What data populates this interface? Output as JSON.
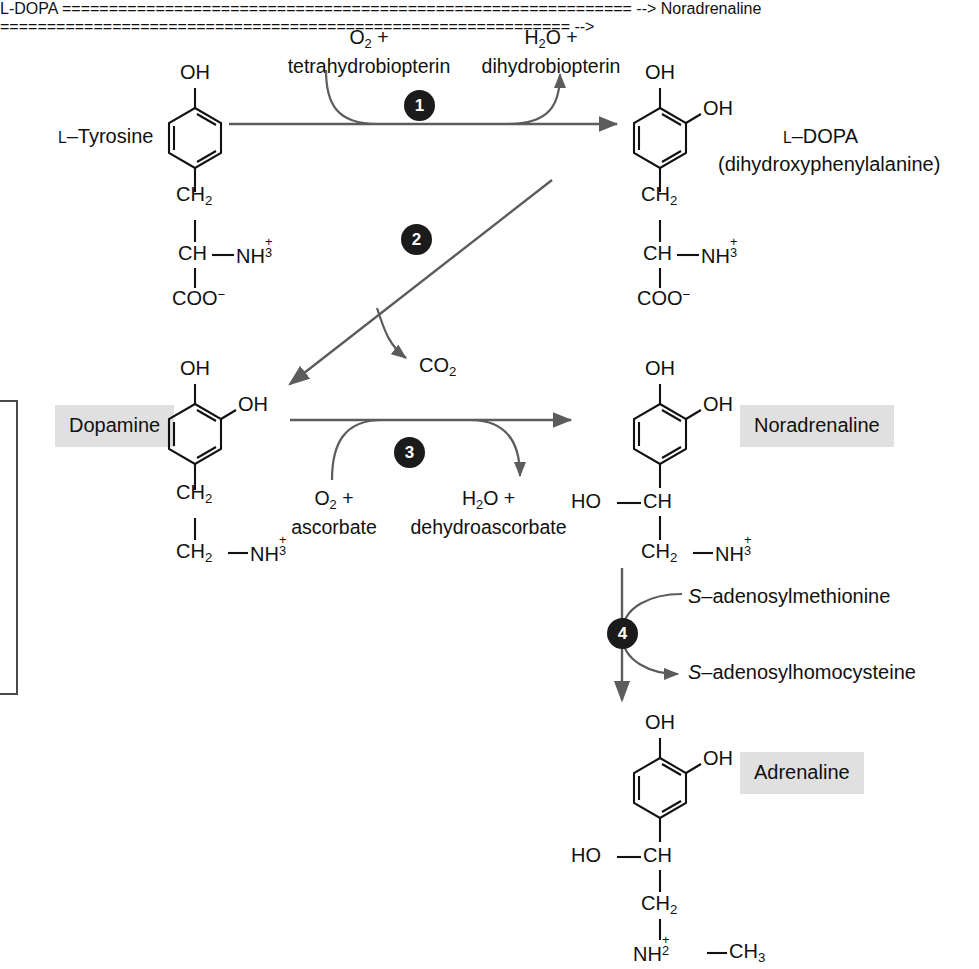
{
  "diagram": {
    "type": "biochemical-pathway",
    "accent_badge_color": "#1b1b1b",
    "arrow_color": "#5c5c5c",
    "bond_color": "#111111",
    "highlight_color": "#e0e0e0"
  },
  "labels": {
    "tyrosine": "L–Tyrosine",
    "tyrosine_prefix": "L",
    "ldopa_line1": "L–DOPA",
    "ldopa_line2": "(dihydroxyphenylalanine)",
    "dopamine": "Dopamine",
    "noradrenaline": "Noradrenaline",
    "adrenaline": "Adrenaline"
  },
  "steps": [
    {
      "number": "1",
      "substrate_line1": "O2 +",
      "substrate_line2": "tetrahydrobiopterin",
      "product_line1": "H2O +",
      "product_line2": "dihydrobiopterin",
      "from": "L–Tyrosine",
      "to": "L–DOPA",
      "direction": "horizontal-right"
    },
    {
      "number": "2",
      "product_line1": "CO2",
      "from": "L–DOPA",
      "to": "Dopamine",
      "direction": "diagonal-down-left"
    },
    {
      "number": "3",
      "substrate_line1": "O2 +",
      "substrate_line2": "ascorbate",
      "product_line1": "H2O +",
      "product_line2": "dehydroascorbate",
      "from": "Dopamine",
      "to": "Noradrenaline",
      "direction": "horizontal-right"
    },
    {
      "number": "4",
      "substrate_line1": "S–adenosylmethionine",
      "product_line1": "S–adenosylhomocysteine",
      "from": "Noradrenaline",
      "to": "Adrenaline",
      "direction": "vertical-down"
    }
  ],
  "molecules": {
    "tyrosine": {
      "name": "L–Tyrosine",
      "ring_substituents": [
        "OH"
      ],
      "chain": [
        "CH2",
        "CH",
        "NH3+",
        "COO−"
      ]
    },
    "ldopa": {
      "name": "L–DOPA",
      "ring_substituents": [
        "OH",
        "OH"
      ],
      "chain": [
        "CH2",
        "CH",
        "NH3+",
        "COO−"
      ]
    },
    "dopamine": {
      "name": "Dopamine",
      "ring_substituents": [
        "OH",
        "OH"
      ],
      "chain": [
        "CH2",
        "CH2",
        "NH3+"
      ]
    },
    "noradrenaline": {
      "name": "Noradrenaline",
      "ring_substituents": [
        "OH",
        "OH"
      ],
      "chain": [
        "HO",
        "CH",
        "CH2",
        "NH3+"
      ]
    },
    "adrenaline": {
      "name": "Adrenaline",
      "ring_substituents": [
        "OH",
        "OH"
      ],
      "chain": [
        "HO",
        "CH",
        "CH2",
        "NH2+",
        "CH3"
      ]
    }
  },
  "chem_text": {
    "OH": "OH",
    "HO": "HO",
    "CH2": "CH",
    "CH2_sub": "2",
    "CH3_sub": "3",
    "CH": "CH",
    "NH": "NH",
    "COO": "COO",
    "CO": "CO",
    "O": "O",
    "H2O_H": "H",
    "dash": "—",
    "minus": "−",
    "plus": "+"
  },
  "cofactor_text": {
    "o2_plus": "O",
    "tetrahydrobiopterin": "tetrahydrobiopterin",
    "h2o_plus": "H",
    "dihydrobiopterin": "dihydrobiopterin",
    "ascorbate": "ascorbate",
    "dehydroascorbate": "dehydroascorbate",
    "co2": "CO",
    "sam": "–adenosylmethionine",
    "sam_italic": "S",
    "sah": "–adenosylhomocysteine",
    "sah_italic": "S"
  }
}
